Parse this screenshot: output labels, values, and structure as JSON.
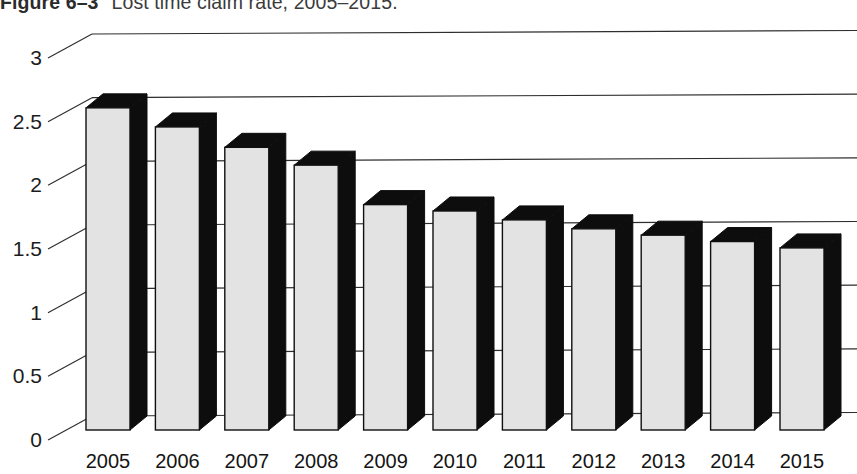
{
  "caption": {
    "figure_number": "Figure 6–3",
    "title": "Lost time claim rate, 2005–2015.",
    "clipped_top": true
  },
  "chart_data": {
    "type": "bar",
    "title": "Lost time claim rate, 2005–2015.",
    "xlabel": "",
    "ylabel": "",
    "categories": [
      "2005",
      "2006",
      "2007",
      "2008",
      "2009",
      "2010",
      "2011",
      "2012",
      "2013",
      "2014",
      "2015"
    ],
    "values": [
      2.53,
      2.38,
      2.22,
      2.08,
      1.77,
      1.72,
      1.65,
      1.58,
      1.53,
      1.48,
      1.43
    ],
    "ylim": [
      0,
      3
    ],
    "ytick_labels": [
      "0",
      "0.5",
      "1",
      "1.5",
      "2",
      "2.5",
      "3"
    ],
    "ytick_values": [
      0,
      0.5,
      1,
      1.5,
      2,
      2.5,
      3
    ],
    "grid": true,
    "legend": null,
    "style": "3d-column",
    "colors": {
      "bar_face": "#e3e3e3",
      "bar_shadow": "#0d0d0d",
      "gridline": "#2e2e2e",
      "text": "#141414",
      "background": "#ffffff"
    }
  }
}
